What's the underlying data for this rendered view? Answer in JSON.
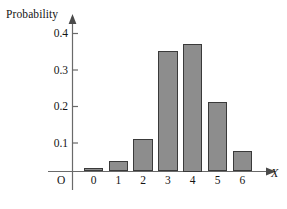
{
  "chart_data": {
    "type": "bar",
    "title": "",
    "xlabel": "X",
    "ylabel": "Probability",
    "categories": [
      "0",
      "1",
      "2",
      "3",
      "4",
      "5",
      "6"
    ],
    "values": [
      0.01,
      0.03,
      0.09,
      0.33,
      0.35,
      0.19,
      0.055
    ],
    "ylim": [
      0,
      0.44
    ],
    "xlim": [
      -0.8,
      7.0
    ],
    "yticks": [
      0.1,
      0.2,
      0.3,
      0.4
    ],
    "ytick_labels": [
      "0.1",
      "0.2",
      "0.3",
      "0.4"
    ],
    "xtick_labels": [
      "0",
      "1",
      "2",
      "3",
      "4",
      "5",
      "6"
    ],
    "origin_label": "O",
    "grid": false,
    "legend": null,
    "bar_fill_color": "#8d8d8d",
    "bar_edge_color": "#3a3a3a",
    "axis_color": "#555555",
    "background_color": "#ffffff"
  },
  "axis": {
    "y_title": "Probability",
    "x_title": "X",
    "origin": "O"
  },
  "yticks": [
    {
      "label": "0.4"
    },
    {
      "label": "0.3"
    },
    {
      "label": "0.2"
    },
    {
      "label": "0.1"
    }
  ],
  "xticks": [
    {
      "label": "0"
    },
    {
      "label": "1"
    },
    {
      "label": "2"
    },
    {
      "label": "3"
    },
    {
      "label": "4"
    },
    {
      "label": "5"
    },
    {
      "label": "6"
    }
  ]
}
